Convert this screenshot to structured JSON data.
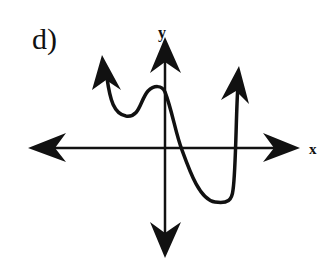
{
  "part_label": "d)",
  "axes": {
    "x_label": "x",
    "y_label": "y"
  },
  "graph": {
    "description": "Polynomial-style curve sketch: rises to +infinity on the left, local min, local max near y-axis, crosses x-axis right of origin, deep local min in quadrant IV, then rises steeply to +infinity on the right crossing the x-axis again",
    "left_end_behavior": "up",
    "right_end_behavior": "up",
    "color": "#111111"
  }
}
